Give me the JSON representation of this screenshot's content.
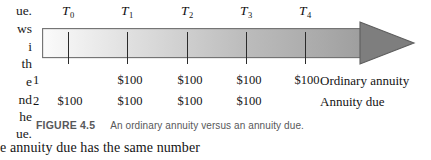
{
  "figure": {
    "caption_label": "FIGURE 4.5",
    "caption_text": "An ordinary annuity versus an annuity due.",
    "timeline": {
      "arrow_color_start": "#f7f7f7",
      "arrow_color_end": "#a5a5a5",
      "arrowhead_color": "#7e7e7e",
      "outline_color": "#6f6f6f",
      "tick_color": "#2b2b2b",
      "periods": [
        {
          "label": "T",
          "sub": "0",
          "x": 68
        },
        {
          "label": "T",
          "sub": "1",
          "x": 127
        },
        {
          "label": "T",
          "sub": "2",
          "x": 187
        },
        {
          "label": "T",
          "sub": "3",
          "x": 246
        },
        {
          "label": "T",
          "sub": "4",
          "x": 305
        }
      ]
    },
    "rows": [
      {
        "number": "1",
        "name": "Ordinary annuity",
        "cells": [
          {
            "value": "",
            "x": 68
          },
          {
            "value": "$100",
            "x": 130
          },
          {
            "value": "$100",
            "x": 190
          },
          {
            "value": "$100",
            "x": 249
          },
          {
            "value": "$100",
            "x": 307
          }
        ]
      },
      {
        "number": "2",
        "name": "Annuity due",
        "cells": [
          {
            "value": "$100",
            "x": 70
          },
          {
            "value": "$100",
            "x": 130
          },
          {
            "value": "$100",
            "x": 190
          },
          {
            "value": "$100",
            "x": 249
          },
          {
            "value": "",
            "x": 307
          }
        ]
      }
    ]
  },
  "page_text": {
    "margin_fragments": [
      "ue.",
      "ws",
      "i",
      "th",
      "e",
      "nd",
      "he",
      "ue."
    ],
    "bottom_line": "e annuity due has the same number"
  }
}
